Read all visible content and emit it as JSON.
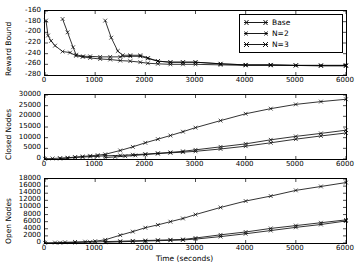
{
  "figure": {
    "xlabel": "Time (seconds)",
    "xticks": [
      "0",
      "1000",
      "2000",
      "3000",
      "4000",
      "5000",
      "6000"
    ],
    "xlim": [
      0,
      6000
    ],
    "legend": {
      "position": "upper-right-panel1",
      "entries": [
        {
          "label": "Base",
          "marker": "x",
          "color": "#000000"
        },
        {
          "label": "N=2",
          "marker": "x",
          "color": "#000000"
        },
        {
          "label": "N=3",
          "marker": "x",
          "color": "#000000"
        }
      ]
    }
  },
  "chart_data": [
    {
      "type": "line",
      "title": "",
      "xlabel": "",
      "ylabel": "Reward Bound",
      "xlim": [
        0,
        6000
      ],
      "ylim": [
        -280,
        -160
      ],
      "yticks": [
        "-160",
        "-180",
        "-200",
        "-220",
        "-240",
        "-260",
        "-280"
      ],
      "xticks": [
        "0",
        "1000",
        "2000",
        "3000",
        "4000",
        "5000",
        "6000"
      ],
      "grid": false,
      "series": [
        {
          "name": "Base",
          "x": [
            20,
            60,
            120,
            200,
            350,
            500,
            620,
            750,
            900,
            1100,
            1300,
            1500,
            1700,
            1900,
            2050,
            2250,
            2500,
            2750,
            3000,
            3500,
            4000,
            4500,
            5000,
            5500,
            6000
          ],
          "y": [
            -178,
            -206,
            -216,
            -225,
            -236,
            -238,
            -244,
            -246,
            -248,
            -250,
            -251,
            -253,
            -254,
            -256,
            -258,
            -259,
            -260,
            -260,
            -260,
            -261,
            -262,
            -262,
            -262,
            -263,
            -263
          ]
        },
        {
          "name": "N=2",
          "x": [
            350,
            450,
            560,
            620,
            760,
            900,
            1100,
            1300,
            1500,
            1700,
            1900,
            2050,
            2250,
            2500,
            2750,
            3000,
            3500,
            4000,
            4500,
            5000,
            5500,
            6000
          ],
          "y": [
            -175,
            -200,
            -228,
            -242,
            -245,
            -245,
            -246,
            -246,
            -246,
            -245,
            -245,
            -249,
            -254,
            -256,
            -256,
            -256,
            -259,
            -261,
            -261,
            -262,
            -262,
            -262
          ]
        },
        {
          "name": "N=3",
          "x": [
            1200,
            1320,
            1450,
            1550,
            1700,
            1900,
            2050,
            2250,
            2500,
            2750,
            3000,
            3500,
            4000,
            4500,
            5000,
            5500,
            6000
          ],
          "y": [
            -178,
            -210,
            -235,
            -243,
            -243,
            -243,
            -248,
            -254,
            -256,
            -256,
            -256,
            -259,
            -261,
            -261,
            -262,
            -262,
            -262
          ]
        }
      ]
    },
    {
      "type": "line",
      "title": "",
      "xlabel": "",
      "ylabel": "Closed Nodes",
      "xlim": [
        0,
        6000
      ],
      "ylim": [
        0,
        30000
      ],
      "yticks": [
        "0",
        "5000",
        "10000",
        "15000",
        "20000",
        "25000",
        "30000"
      ],
      "xticks": [
        "0",
        "1000",
        "2000",
        "3000",
        "4000",
        "5000",
        "6000"
      ],
      "grid": false,
      "series": [
        {
          "name": "Base",
          "x": [
            0,
            150,
            300,
            450,
            600,
            750,
            900,
            1050,
            1200,
            1500,
            1750,
            2000,
            2250,
            2500,
            2750,
            3000,
            3500,
            4000,
            4500,
            5000,
            5500,
            6000
          ],
          "y": [
            100,
            250,
            400,
            600,
            900,
            1200,
            1500,
            1800,
            2200,
            4000,
            5700,
            7600,
            9300,
            11000,
            12800,
            14700,
            18000,
            21200,
            23600,
            25600,
            26900,
            28000
          ]
        },
        {
          "name": "N=2",
          "x": [
            300,
            450,
            600,
            750,
            900,
            1050,
            1200,
            1500,
            1750,
            2000,
            2250,
            2500,
            2750,
            3000,
            3500,
            4000,
            4500,
            5000,
            5500,
            6000
          ],
          "y": [
            200,
            400,
            700,
            900,
            1100,
            1300,
            1500,
            1700,
            2000,
            2300,
            2700,
            3100,
            3600,
            4300,
            5700,
            7100,
            9000,
            10600,
            12000,
            13500
          ]
        },
        {
          "name": "N=3",
          "x": [
            1200,
            1400,
            1600,
            1800,
            2000,
            2250,
            2500,
            2750,
            3000,
            3500,
            4000,
            4500,
            5000,
            5500,
            6000
          ],
          "y": [
            700,
            1000,
            1300,
            1700,
            2100,
            2500,
            2900,
            3200,
            3600,
            4700,
            6000,
            7600,
            9300,
            10800,
            12200
          ]
        }
      ]
    },
    {
      "type": "line",
      "title": "",
      "xlabel": "Time (seconds)",
      "ylabel": "Open Nodes",
      "xlim": [
        0,
        6000
      ],
      "ylim": [
        0,
        18000
      ],
      "yticks": [
        "0",
        "2000",
        "4000",
        "6000",
        "8000",
        "10000",
        "12000",
        "14000",
        "16000",
        "18000"
      ],
      "xticks": [
        "0",
        "1000",
        "2000",
        "3000",
        "4000",
        "5000",
        "6000"
      ],
      "grid": false,
      "series": [
        {
          "name": "Base",
          "x": [
            0,
            200,
            400,
            600,
            800,
            1000,
            1200,
            1500,
            1750,
            2000,
            2250,
            2500,
            2750,
            3000,
            3500,
            4000,
            4500,
            5000,
            5500,
            6000
          ],
          "y": [
            60,
            120,
            200,
            280,
            380,
            500,
            900,
            2200,
            3200,
            4300,
            5100,
            6000,
            6900,
            8000,
            10000,
            11800,
            13200,
            14800,
            15900,
            17000
          ]
        },
        {
          "name": "N=2",
          "x": [
            300,
            600,
            900,
            1200,
            1500,
            1750,
            2000,
            2250,
            2500,
            2750,
            3000,
            3500,
            4000,
            4500,
            5000,
            5500,
            6000
          ],
          "y": [
            80,
            150,
            250,
            400,
            500,
            600,
            700,
            800,
            900,
            1000,
            1400,
            2300,
            3100,
            4100,
            4900,
            5700,
            6500
          ]
        },
        {
          "name": "N=3",
          "x": [
            1200,
            1500,
            1750,
            2000,
            2250,
            2500,
            2750,
            3000,
            3500,
            4000,
            4500,
            5000,
            5500,
            6000
          ],
          "y": [
            200,
            350,
            450,
            550,
            650,
            750,
            850,
            1100,
            1800,
            2600,
            3500,
            4400,
            5200,
            6200
          ]
        }
      ]
    }
  ]
}
